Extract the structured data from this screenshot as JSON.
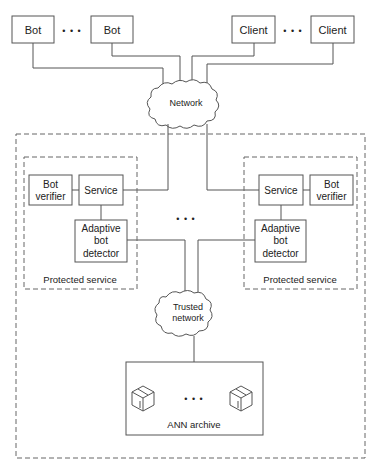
{
  "top_row": {
    "bots": [
      {
        "label": "Bot"
      },
      {
        "label": "Bot"
      }
    ],
    "clients": [
      {
        "label": "Client"
      },
      {
        "label": "Client"
      }
    ],
    "ellipsis": "• • •"
  },
  "network": {
    "label": "Network"
  },
  "protected_services": [
    {
      "label": "Protected service",
      "service": "Service",
      "verifier": [
        "Bot",
        "verifier"
      ],
      "detector": [
        "Adaptive",
        "bot",
        "detector"
      ]
    },
    {
      "label": "Protected service",
      "service": "Service",
      "verifier": [
        "Bot",
        "verifier"
      ],
      "detector": [
        "Adaptive",
        "bot",
        "detector"
      ]
    }
  ],
  "middle_ellipsis": "• • •",
  "trusted_network": {
    "label": [
      "Trusted",
      "network"
    ]
  },
  "archive": {
    "label": "ANN archive",
    "ellipsis": "• • •"
  },
  "colors": {
    "line": "#555555",
    "dashed": "#666666",
    "text": "#222222"
  }
}
